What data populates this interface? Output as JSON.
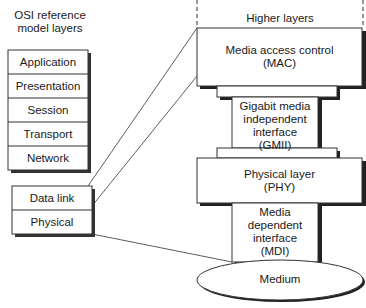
{
  "osi": {
    "title_line1": "OSI reference",
    "title_line2": "model layers",
    "upper_layers": [
      "Application",
      "Presentation",
      "Session",
      "Transport",
      "Network"
    ],
    "lower_layers": [
      "Data link",
      "Physical"
    ]
  },
  "gigabit": {
    "higher_layers": "Higher layers",
    "mac": {
      "line1": "Media access control",
      "line2": "(MAC)"
    },
    "gmii": {
      "line1": "Gigabit media",
      "line2": "independent",
      "line3": "interface",
      "line4": "(GMII)"
    },
    "phy": {
      "line1": "Physical layer",
      "line2": "(PHY)"
    },
    "mdi": {
      "line1": "Media",
      "line2": "dependent",
      "line3": "interface",
      "line4": "(MDI)"
    },
    "medium": "Medium"
  }
}
